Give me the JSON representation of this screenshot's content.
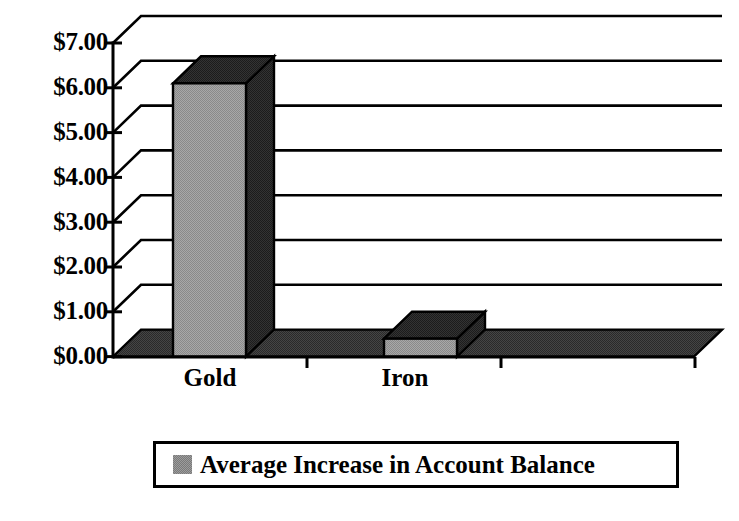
{
  "chart_data": {
    "type": "bar",
    "title": "",
    "subtitle": "",
    "xlabel": "",
    "ylabel": "",
    "categories": [
      "Gold",
      "Iron"
    ],
    "values": [
      6.1,
      0.4
    ],
    "series": [
      {
        "name": "Average Increase in Account Balance",
        "values": [
          6.1,
          0.4
        ]
      }
    ],
    "ylim": [
      0,
      7
    ],
    "ytick_step": 1,
    "ytick_labels": [
      "$7.00",
      "$6.00",
      "$5.00",
      "$4.00",
      "$3.00",
      "$2.00",
      "$1.00",
      "$0.00"
    ],
    "ytick_values": [
      7,
      6,
      5,
      4,
      3,
      2,
      1,
      0
    ],
    "grid": true,
    "grid_axis": "y",
    "legend": {
      "position": "bottom",
      "entries": [
        {
          "label": "Average Increase in Account Balance",
          "swatch_name": "legend-color-swatch",
          "color": "#9c9c9c"
        }
      ]
    },
    "style": {
      "three_d": true,
      "bar_front_color": "#9c9c9c",
      "bar_side_color": "#2b2b2b",
      "bar_top_color": "#3a3a3a",
      "floor_color": "#3a3a3a",
      "axis_color": "#000000",
      "background": "#ffffff",
      "text_color": "#000000"
    }
  },
  "axis": {
    "y_ticks": [
      {
        "label": "$7.00",
        "value": 7
      },
      {
        "label": "$6.00",
        "value": 6
      },
      {
        "label": "$5.00",
        "value": 5
      },
      {
        "label": "$4.00",
        "value": 4
      },
      {
        "label": "$3.00",
        "value": 3
      },
      {
        "label": "$2.00",
        "value": 2
      },
      {
        "label": "$1.00",
        "value": 1
      },
      {
        "label": "$0.00",
        "value": 0
      }
    ],
    "x_categories": [
      {
        "label": "Gold"
      },
      {
        "label": "Iron"
      }
    ]
  },
  "legend": {
    "label": "Average Increase in Account Balance"
  }
}
